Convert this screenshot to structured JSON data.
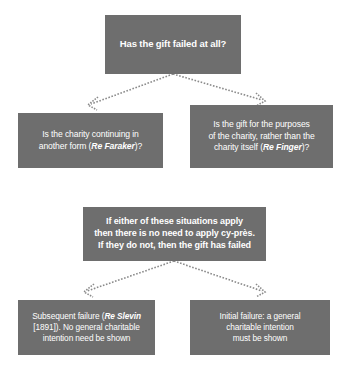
{
  "diagram": {
    "type": "flowchart",
    "background_color": "#ffffff",
    "node_fill_color": "#6e6e6e",
    "node_text_color": "#ffffff",
    "connector_color": "#8b8b8b",
    "connector_style": "dotted-arrow"
  },
  "nodes": {
    "root": {
      "id": "root",
      "role": "question",
      "lines": [
        "Has the gift failed at all?"
      ]
    },
    "faraker": {
      "id": "faraker",
      "role": "question",
      "lines": [
        "Is the charity continuing in",
        "another form (",
        "Re Faraker",
        ")?"
      ],
      "line1": "Is the charity continuing in",
      "line2_prefix": "another form (",
      "line2_case": "Re Faraker",
      "line2_suffix": ")?"
    },
    "finger": {
      "id": "finger",
      "role": "question",
      "line1": "Is the gift for the purposes",
      "line2": "of the charity, rather than the",
      "line3_prefix": "charity itself (",
      "line3_case": "Re Finger",
      "line3_suffix": ")?"
    },
    "rule": {
      "id": "rule",
      "role": "statement",
      "line1": "If either of these situations apply",
      "line2": "then there is no need to apply cy-près.",
      "line3": "If they do not, then the gift has failed"
    },
    "subsequent": {
      "id": "subsequent",
      "role": "outcome",
      "line1_prefix": "Subsequent failure (",
      "line1_case": "Re Slevin",
      "line2": "[1891]). No general charitable",
      "line3": "intention need be shown"
    },
    "initial": {
      "id": "initial",
      "role": "outcome",
      "line1": "Initial failure: a general",
      "line2": "charitable intention",
      "line3": "must be shown"
    }
  },
  "edges": [
    {
      "from": "root",
      "to": "faraker",
      "style": "dotted",
      "arrow": "open"
    },
    {
      "from": "root",
      "to": "finger",
      "style": "dotted",
      "arrow": "open"
    },
    {
      "from": "rule",
      "to": "subsequent",
      "style": "dotted",
      "arrow": "open"
    },
    {
      "from": "rule",
      "to": "initial",
      "style": "dotted",
      "arrow": "open"
    }
  ]
}
